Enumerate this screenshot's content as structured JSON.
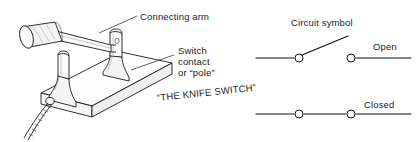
{
  "figure": {
    "caption": "“THE KNIFE SWITCH”",
    "labels": {
      "connecting_arm": "Connecting arm",
      "switch_contact_line1": "Switch",
      "switch_contact_line2": "contact",
      "switch_contact_line3": "or “pole”",
      "circuit_symbol": "Circuit symbol"
    },
    "states": {
      "open": "Open",
      "closed": "Closed"
    },
    "colors": {
      "ink": "#1a1a1a",
      "background": "#ffffff",
      "metal_fill": "#f4f4f4",
      "wood_fill": "#fdfdfd"
    },
    "parts": {
      "handle": "insulated-handle",
      "arm": "connecting-arm",
      "post_left": "switch-contact-post-left",
      "post_right": "switch-contact-post-right",
      "base": "wooden-base",
      "wire": "twisted-lead-wire"
    }
  }
}
